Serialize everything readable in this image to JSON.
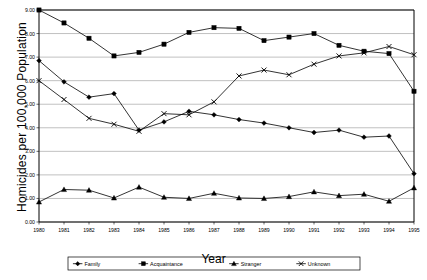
{
  "chart_data": {
    "type": "line",
    "title": "",
    "xlabel": "Year",
    "ylabel": "Homicides per 100,000 Population",
    "x": [
      1980,
      1981,
      1982,
      1983,
      1984,
      1985,
      1986,
      1987,
      1988,
      1989,
      1990,
      1991,
      1992,
      1993,
      1994,
      1995
    ],
    "xtick_labels": [
      "1980",
      "1981",
      "1982",
      "1983",
      "1984",
      "1985",
      "1986",
      "1987",
      "1988",
      "1989",
      "1990",
      "1991",
      "1992",
      "1993",
      "1994",
      "1995"
    ],
    "ytick_labels": [
      "0.00",
      "1.00",
      "2.00",
      "3.00",
      "4.00",
      "5.00",
      "6.00",
      "7.00",
      "8.00",
      "9.00"
    ],
    "ylim": [
      0,
      9
    ],
    "xlim": [
      1980,
      1995
    ],
    "grid": true,
    "legend_position": "bottom",
    "series": [
      {
        "name": "Family",
        "marker": "diamond",
        "values": [
          6.85,
          5.95,
          5.3,
          5.45,
          3.9,
          4.25,
          4.7,
          4.55,
          4.35,
          4.2,
          4.0,
          3.8,
          3.9,
          3.6,
          3.65,
          2.05
        ]
      },
      {
        "name": "Acquaintance",
        "marker": "square",
        "values": [
          9.0,
          8.45,
          7.8,
          7.05,
          7.2,
          7.55,
          8.05,
          8.25,
          8.22,
          7.7,
          7.85,
          8.0,
          7.5,
          7.25,
          7.15,
          5.55
        ]
      },
      {
        "name": "Stranger",
        "marker": "triangle",
        "values": [
          0.85,
          1.38,
          1.35,
          1.02,
          1.48,
          1.05,
          1.0,
          1.22,
          1.02,
          1.0,
          1.08,
          1.28,
          1.12,
          1.18,
          0.88,
          1.45
        ]
      },
      {
        "name": "Unknown",
        "marker": "cross",
        "values": [
          6.0,
          5.2,
          4.4,
          4.15,
          3.85,
          4.6,
          4.55,
          5.1,
          6.2,
          6.45,
          6.25,
          6.7,
          7.05,
          7.18,
          7.45,
          7.1
        ]
      }
    ]
  },
  "axis": {
    "y_title": "Homicides per 100,000 Population",
    "x_title": "Year"
  },
  "legend": {
    "items": [
      {
        "label": "Family",
        "marker": "diamond-marker"
      },
      {
        "label": "Acquaintance",
        "marker": "square-marker"
      },
      {
        "label": "Stranger",
        "marker": "triangle-marker"
      },
      {
        "label": "Unknown",
        "marker": "cross-marker"
      }
    ]
  },
  "colors": {
    "line": "#000000",
    "grid": "#808080",
    "axis": "#000000",
    "background": "#ffffff"
  }
}
